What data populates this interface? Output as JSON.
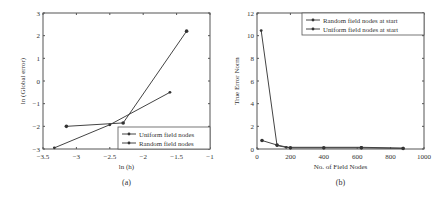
{
  "chart_data": [
    {
      "type": "line",
      "caption": "(a)",
      "title": "",
      "xlabel": "ln (h)",
      "ylabel": "ln (Global error)",
      "xlim": [
        -3.5,
        -1
      ],
      "ylim": [
        -3,
        3
      ],
      "xticks": [
        "-3.5",
        "-3",
        "-2.5",
        "-2",
        "-1.5",
        "-1"
      ],
      "yticks": [
        "-3",
        "-2",
        "-1",
        "0",
        "1",
        "2",
        "3"
      ],
      "grid": false,
      "legend_position": "lower right",
      "series": [
        {
          "name": "Uniform field nodes",
          "x": [
            -3.33,
            -2.5,
            -1.6
          ],
          "y": [
            -2.95,
            -1.93,
            -0.5
          ]
        },
        {
          "name": "Random field nodes",
          "x": [
            -3.15,
            -2.3,
            -1.35
          ],
          "y": [
            -2.0,
            -1.85,
            2.2
          ]
        }
      ]
    },
    {
      "type": "line",
      "caption": "(b)",
      "title": "",
      "xlabel": "No. of Field Nodes",
      "ylabel": "True Error Norm",
      "xlim": [
        0,
        1000
      ],
      "ylim": [
        0,
        12
      ],
      "xticks": [
        "0",
        "200",
        "400",
        "600",
        "800",
        "1000"
      ],
      "yticks": [
        "0",
        "2",
        "4",
        "6",
        "8",
        "10",
        "12"
      ],
      "grid": false,
      "legend_position": "upper right",
      "series": [
        {
          "name": "Random field nodes at start",
          "x": [
            25,
            120,
            175,
            625,
            875
          ],
          "y": [
            10.45,
            0.3,
            0.15,
            0.15,
            0.08
          ]
        },
        {
          "name": "Uniform field nodes at start",
          "x": [
            30,
            120,
            200,
            400,
            625,
            875
          ],
          "y": [
            0.75,
            0.35,
            0.1,
            0.1,
            0.1,
            0.05
          ]
        }
      ]
    }
  ]
}
